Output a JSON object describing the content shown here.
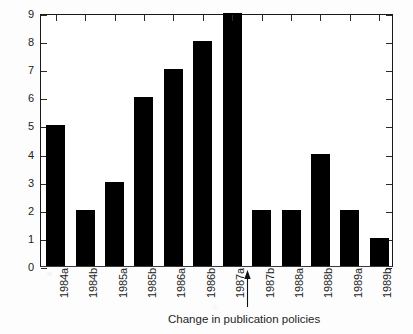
{
  "chart_data": {
    "type": "bar",
    "title": "",
    "subtitle": "",
    "xlabel": "",
    "ylabel": "",
    "categories": [
      "1984a",
      "1984b",
      "1985a",
      "1985b",
      "1986a",
      "1986b",
      "1987a",
      "1987b",
      "1988a",
      "1988b",
      "1989a",
      "1989b"
    ],
    "values": [
      5,
      2,
      3,
      6,
      7,
      8,
      9,
      2,
      2,
      4,
      2,
      1
    ],
    "ylim": [
      0,
      9
    ],
    "yticks": [
      0,
      1,
      2,
      3,
      4,
      5,
      6,
      7,
      8,
      9
    ],
    "ytick_labels": [
      "0",
      "1",
      "2",
      "3",
      "4",
      "5",
      "6",
      "7",
      "8",
      "9"
    ],
    "grid": false,
    "legend": null,
    "bar_color": "#000000",
    "axis_color": "#1a1a1a",
    "background_color": "#ffffff",
    "annotations": [
      {
        "name": "policy-change-arrow",
        "type": "up-arrow",
        "label": "Change in publication policies",
        "between": [
          "1987a",
          "1987b"
        ]
      }
    ]
  },
  "caption": {
    "text": "Change in publication policies"
  },
  "axes": {
    "y_labels": [
      "9",
      "8",
      "7",
      "6",
      "5",
      "4",
      "3",
      "2",
      "1",
      "0"
    ],
    "x_labels": [
      "1984a",
      "1984b",
      "1985a",
      "1985b",
      "1986a",
      "1986b",
      "1987a",
      "1987b",
      "1988a",
      "1988b",
      "1989a",
      "1989b"
    ]
  },
  "icons": {
    "arrow_up": "up-arrow-icon"
  }
}
